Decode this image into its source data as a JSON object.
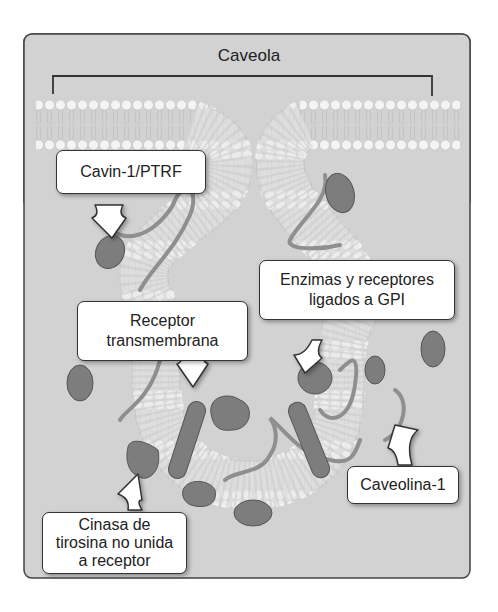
{
  "diagram": {
    "title": "Caveola",
    "background_color": "#d2d2d2",
    "protein_color": "#7d7d7d",
    "labels": {
      "cavin": "Cavin-1/PTRF",
      "gpi_line1": "Enzimas y receptores",
      "gpi_line2": "ligados a GPI",
      "receptor_line1": "Receptor",
      "receptor_line2": "transmembrana",
      "caveolin": "Caveolina-1",
      "kinase_line1": "Cinasa de",
      "kinase_line2": "tirosina no unida",
      "kinase_line3": "a receptor"
    }
  }
}
